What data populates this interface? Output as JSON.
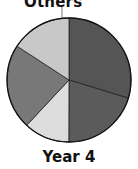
{
  "chart_data": {
    "type": "pie",
    "title": "Year 4",
    "start_angle_deg": 0,
    "direction": "clockwise",
    "slices": [
      {
        "label": "",
        "value": 29.7,
        "color": "#555555"
      },
      {
        "label": "",
        "value": 20.3,
        "color": "#5b5b5b"
      },
      {
        "label": "",
        "value": 11.9,
        "color": "#dcdcdc"
      },
      {
        "label": "",
        "value": 22.2,
        "color": "#787878"
      },
      {
        "label": "Others",
        "value": 15.8,
        "color": "#c8c8c8"
      }
    ],
    "annotations": [
      {
        "text": "Others",
        "points_to_slice": 4
      }
    ]
  },
  "labels": {
    "others": "Others",
    "title": "Year 4"
  }
}
